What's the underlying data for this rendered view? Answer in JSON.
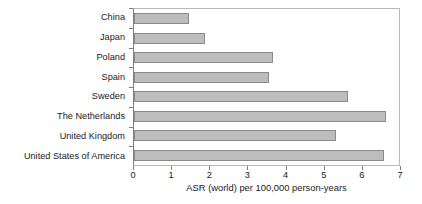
{
  "chart_data": {
    "type": "bar",
    "orientation": "horizontal",
    "title": "",
    "xlabel": "ASR (world) per 100,000 person-years",
    "ylabel": "",
    "xlim": [
      0,
      7
    ],
    "ylim": null,
    "grid": false,
    "legend": null,
    "xticks": [
      "0",
      "1",
      "2",
      "3",
      "4",
      "5",
      "6",
      "7"
    ],
    "categories": [
      "China",
      "Japan",
      "Poland",
      "Spain",
      "Sweden",
      "The Netherlands",
      "United Kingdom",
      "United States of America"
    ],
    "values": [
      1.45,
      1.85,
      3.65,
      3.55,
      5.6,
      6.6,
      5.3,
      6.55
    ],
    "series": [
      {
        "name": "ASR (world) per 100,000 person-years",
        "values": [
          1.45,
          1.85,
          3.65,
          3.55,
          5.6,
          6.6,
          5.3,
          6.55
        ]
      }
    ],
    "bar_color": "#bdbdbd",
    "bar_border_color": "#8a8a8a",
    "frame_color": "#b8b8b8",
    "axis_color": "#808080",
    "background": "#ffffff"
  }
}
